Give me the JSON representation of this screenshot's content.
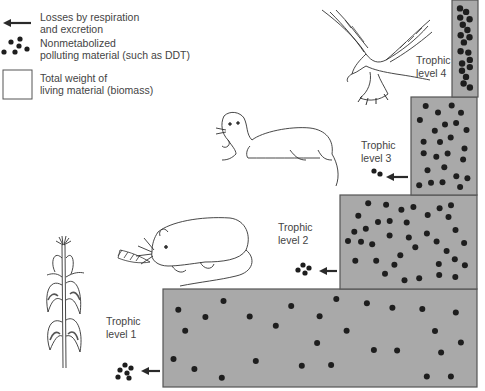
{
  "legend": {
    "items": [
      {
        "icon": "arrow-left-icon",
        "lines": [
          "Losses by respiration",
          "and excretion"
        ]
      },
      {
        "icon": "pollutant-dots-icon",
        "lines": [
          "Nonmetabolized",
          "polluting material  (such as DDT)"
        ]
      },
      {
        "icon": "biomass-box-icon",
        "lines": [
          "Total weight of",
          "living material  (biomass)"
        ]
      }
    ]
  },
  "colors": {
    "biomass_fill": "#a9a9a9",
    "biomass_stroke": "#555555",
    "pollutant_dot": "#1e1e1e",
    "arrow": "#2a2a2a",
    "text": "#444444"
  },
  "trophic_levels": [
    {
      "level": 1,
      "label_lines": [
        "Trophic",
        "level 1"
      ],
      "organism": "corn plant",
      "pollutant_dot_count": 28,
      "released_dot_count": 6
    },
    {
      "level": 2,
      "label_lines": [
        "Trophic",
        "level 2"
      ],
      "organism": "rat",
      "pollutant_dot_count": 37,
      "released_dot_count": 4
    },
    {
      "level": 3,
      "label_lines": [
        "Trophic",
        "level 3"
      ],
      "organism": "weasel",
      "pollutant_dot_count": 30,
      "released_dot_count": 2
    },
    {
      "level": 4,
      "label_lines": [
        "Trophic",
        "level 4"
      ],
      "organism": "hawk",
      "pollutant_dot_count": 32,
      "released_dot_count": 0
    }
  ]
}
